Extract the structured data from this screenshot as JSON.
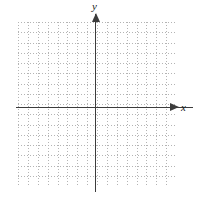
{
  "figure": {
    "type": "coordinate-plane",
    "title": "",
    "axis_labels": {
      "x": "x",
      "y": "y"
    },
    "grid": {
      "style": "dotted",
      "color": "#b4b4b4",
      "columns": 16,
      "rows": 16,
      "cell_width_px": 9.875,
      "cell_height_px": 10.25,
      "left_px": 18,
      "top_px": 22,
      "width_px": 158,
      "height_px": 164
    },
    "axes": {
      "color": "#3c3c3c",
      "origin_x_px": 96,
      "origin_y_px": 108,
      "x_axis_arrow": "right",
      "y_axis_arrow": "up"
    },
    "chart_data": {
      "type": "scatter",
      "title": "",
      "xlabel": "x",
      "ylabel": "y",
      "xlim": [
        -8,
        8
      ],
      "ylim": [
        -8,
        8
      ],
      "xticks": [],
      "yticks": [],
      "grid": true,
      "legend": null,
      "series": [],
      "annotations": []
    }
  }
}
